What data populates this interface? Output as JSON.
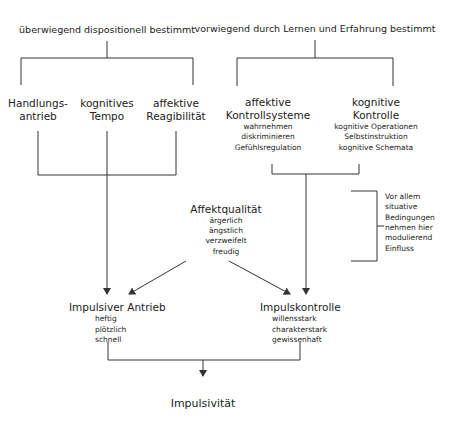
{
  "diagram": {
    "left_header": "überwiegend dispositionell bestimmt",
    "right_header": "vorwiegend durch Lernen und Erfahrung bestimmt",
    "left_factors": [
      {
        "line1": "Handlungs-",
        "line2": "antrieb"
      },
      {
        "line1": "kognitives",
        "line2": "Tempo"
      },
      {
        "line1": "affektive",
        "line2": "Reagibilität"
      }
    ],
    "affective_control": {
      "title1": "affektive",
      "title2": "Kontrollsysteme",
      "items": [
        "wahrnehmen",
        "diskriminieren",
        "Gefühlsregulation"
      ]
    },
    "cognitive_control": {
      "title1": "kognitive",
      "title2": "Kontrolle",
      "items": [
        "kognitive Operationen",
        "Selbstinstruktion",
        "kognitive Schemata"
      ]
    },
    "situational_note": {
      "lines": [
        "Vor allem",
        "situative",
        "Bedingungen",
        "nehmen hier",
        "modulierend",
        "Einfluss"
      ]
    },
    "affect_quality": {
      "title": "Affektqualität",
      "items": [
        "ärgerlich",
        "ängstlich",
        "verzweifelt",
        "freudig"
      ]
    },
    "impulsive_drive": {
      "title": "Impulsiver Antrieb",
      "items": [
        "heftig",
        "plötzlich",
        "schnell"
      ]
    },
    "impulse_control": {
      "title": "Impulskontrolle",
      "items": [
        "willensstark",
        "charakterstark",
        "gewissenhaft"
      ]
    },
    "result": "Impulsivität",
    "line_color": "#333333"
  }
}
